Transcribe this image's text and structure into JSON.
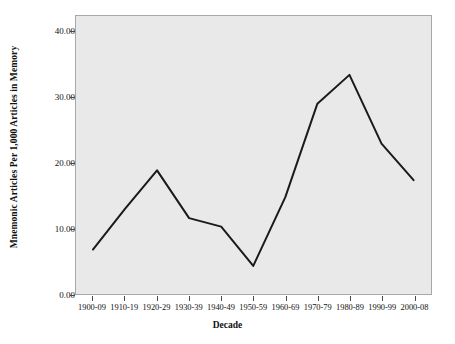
{
  "chart_data": {
    "type": "line",
    "title": "",
    "xlabel": "Decade",
    "ylabel": "Mnemonic Articles Per 1,000 Articles in Memory",
    "categories": [
      "1900-09",
      "1910-19",
      "1920-29",
      "1930-39",
      "1940-49",
      "1950-59",
      "1960-69",
      "1970-79",
      "1980-89",
      "1990-99",
      "2000-08"
    ],
    "values": [
      6.8,
      13.0,
      18.9,
      11.6,
      10.3,
      4.3,
      14.8,
      29.1,
      33.5,
      23.0,
      17.4
    ],
    "ylim": [
      0,
      42.5
    ],
    "yticks": [
      0,
      10,
      20,
      30,
      40
    ],
    "ytick_labels": [
      "0.00",
      "10.00",
      "20.00",
      "30.00",
      "40.00"
    ],
    "grid": false,
    "legend": null,
    "series_color": "#1a1a1a",
    "plot_background": "#e9e9e9",
    "figure_background": "#ffffff",
    "line_width": 2
  }
}
